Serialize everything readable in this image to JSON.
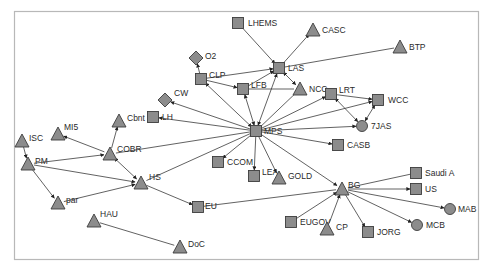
{
  "diagram": {
    "type": "directed network graph",
    "colors": {
      "node_fill": "#8c8c8c",
      "node_stroke": "#3c3c3c",
      "edge": "#3a3a3a",
      "frame": "#b8b8b8",
      "label": "#2a2a2a"
    },
    "nodes": [
      {
        "id": "LHEMS",
        "label": "LHEMS",
        "shape": "square",
        "x": 238,
        "y": 23,
        "lx": 10,
        "ly": 3
      },
      {
        "id": "CASC",
        "label": "CASC",
        "shape": "triangle",
        "x": 313,
        "y": 30,
        "lx": 9,
        "ly": 3
      },
      {
        "id": "BTP",
        "label": "BTP",
        "shape": "triangle",
        "x": 400,
        "y": 47,
        "lx": 9,
        "ly": 3
      },
      {
        "id": "O2",
        "label": "O2",
        "shape": "diamond",
        "x": 196,
        "y": 58,
        "lx": 9,
        "ly": 1
      },
      {
        "id": "CLP",
        "label": "CLP",
        "shape": "square",
        "x": 201,
        "y": 79,
        "lx": 8,
        "ly": -1
      },
      {
        "id": "LAS",
        "label": "LAS",
        "shape": "square",
        "x": 279,
        "y": 68,
        "lx": 9,
        "ly": 3
      },
      {
        "id": "LFB",
        "label": "LFB",
        "shape": "square",
        "x": 243,
        "y": 89,
        "lx": 8,
        "ly": -1
      },
      {
        "id": "NCC",
        "label": "NCC",
        "shape": "triangle",
        "x": 300,
        "y": 89,
        "lx": 9,
        "ly": 3
      },
      {
        "id": "LRT",
        "label": "LRT",
        "shape": "square",
        "x": 331,
        "y": 94,
        "lx": 8,
        "ly": -1
      },
      {
        "id": "WCC",
        "label": "WCC",
        "shape": "square",
        "x": 378,
        "y": 100,
        "lx": 10,
        "ly": 3
      },
      {
        "id": "CW",
        "label": "CW",
        "shape": "diamond",
        "x": 165,
        "y": 100,
        "lx": 9,
        "ly": -4
      },
      {
        "id": "LH",
        "label": "LH",
        "shape": "square",
        "x": 153,
        "y": 117,
        "lx": 9,
        "ly": 3
      },
      {
        "id": "MPS",
        "label": "MPS",
        "shape": "square",
        "x": 256,
        "y": 131,
        "lx": 8,
        "ly": 3
      },
      {
        "id": "7JAS",
        "label": "7JAS",
        "shape": "circle",
        "x": 362,
        "y": 126,
        "lx": 9,
        "ly": 3
      },
      {
        "id": "CASB",
        "label": "CASB",
        "shape": "square",
        "x": 338,
        "y": 145,
        "lx": 9,
        "ly": 3
      },
      {
        "id": "MI5",
        "label": "MI5",
        "shape": "triangle",
        "x": 58,
        "y": 134,
        "lx": 6,
        "ly": -4
      },
      {
        "id": "Cbnt",
        "label": "Cbnt",
        "shape": "triangle",
        "x": 119,
        "y": 121,
        "lx": 8,
        "ly": 0
      },
      {
        "id": "ISC",
        "label": "ISC",
        "shape": "triangle",
        "x": 22,
        "y": 141,
        "lx": 7,
        "ly": 0
      },
      {
        "id": "COBR",
        "label": "COBR",
        "shape": "triangle",
        "x": 110,
        "y": 154,
        "lx": 7,
        "ly": -2
      },
      {
        "id": "PM",
        "label": "PM",
        "shape": "triangle",
        "x": 28,
        "y": 164,
        "lx": 7,
        "ly": 0
      },
      {
        "id": "HS",
        "label": "HS",
        "shape": "triangle",
        "x": 141,
        "y": 183,
        "lx": 8,
        "ly": -3
      },
      {
        "id": "CCOM",
        "label": "CCOM",
        "shape": "square",
        "x": 218,
        "y": 162,
        "lx": 9,
        "ly": 3
      },
      {
        "id": "LEA",
        "label": "LEA",
        "shape": "square",
        "x": 254,
        "y": 176,
        "lx": 8,
        "ly": -1
      },
      {
        "id": "GOLD",
        "label": "GOLD",
        "shape": "triangle",
        "x": 279,
        "y": 178,
        "lx": 9,
        "ly": 1
      },
      {
        "id": "BG",
        "label": "BG",
        "shape": "triangle",
        "x": 342,
        "y": 189,
        "lx": 6,
        "ly": -1
      },
      {
        "id": "Saudi A",
        "label": "Saudi A",
        "shape": "square",
        "x": 416,
        "y": 173,
        "lx": 9,
        "ly": 3
      },
      {
        "id": "US",
        "label": "US",
        "shape": "square",
        "x": 416,
        "y": 189,
        "lx": 9,
        "ly": 3
      },
      {
        "id": "MAB",
        "label": "MAB",
        "shape": "circle",
        "x": 450,
        "y": 209,
        "lx": 8,
        "ly": 3
      },
      {
        "id": "EU",
        "label": "EU",
        "shape": "square",
        "x": 198,
        "y": 207,
        "lx": 7,
        "ly": 2
      },
      {
        "id": "par",
        "label": "par",
        "shape": "triangle",
        "x": 58,
        "y": 203,
        "lx": 8,
        "ly": 0
      },
      {
        "id": "EUGOV",
        "label": "EUGOV",
        "shape": "square",
        "x": 291,
        "y": 222,
        "lx": 9,
        "ly": 3
      },
      {
        "id": "CP",
        "label": "CP",
        "shape": "triangle",
        "x": 327,
        "y": 229,
        "lx": 9,
        "ly": 1
      },
      {
        "id": "JORG",
        "label": "JORG",
        "shape": "square",
        "x": 368,
        "y": 232,
        "lx": 9,
        "ly": 3
      },
      {
        "id": "MCB",
        "label": "MCB",
        "shape": "circle",
        "x": 417,
        "y": 225,
        "lx": 9,
        "ly": 3
      },
      {
        "id": "HAU",
        "label": "HAU",
        "shape": "triangle",
        "x": 94,
        "y": 221,
        "lx": 6,
        "ly": -4
      },
      {
        "id": "DoC",
        "label": "DoC",
        "shape": "triangle",
        "x": 180,
        "y": 247,
        "lx": 8,
        "ly": 0
      }
    ],
    "edges": [
      {
        "from": "LHEMS",
        "to": "LAS"
      },
      {
        "from": "LAS",
        "to": "CASC"
      },
      {
        "from": "BTP",
        "to": "LAS",
        "arrow": false
      },
      {
        "from": "CLP",
        "to": "O2"
      },
      {
        "from": "CLP",
        "to": "LAS"
      },
      {
        "from": "CLP",
        "to": "LFB"
      },
      {
        "from": "LFB",
        "to": "LAS"
      },
      {
        "from": "NCC",
        "to": "LAS",
        "both": true
      },
      {
        "from": "LFB",
        "to": "NCC",
        "arrow": false
      },
      {
        "from": "LRT",
        "to": "WCC"
      },
      {
        "from": "LRT",
        "to": "7JAS",
        "both": true
      },
      {
        "from": "7JAS",
        "to": "WCC",
        "both": true
      },
      {
        "from": "MPS",
        "to": "CLP",
        "both": true
      },
      {
        "from": "MPS",
        "to": "LFB",
        "both": true
      },
      {
        "from": "MPS",
        "to": "LAS",
        "both": true
      },
      {
        "from": "MPS",
        "to": "NCC",
        "arrow": false
      },
      {
        "from": "MPS",
        "to": "LRT"
      },
      {
        "from": "MPS",
        "to": "WCC"
      },
      {
        "from": "MPS",
        "to": "7JAS"
      },
      {
        "from": "MPS",
        "to": "CASB"
      },
      {
        "from": "MPS",
        "to": "CW"
      },
      {
        "from": "MPS",
        "to": "LH"
      },
      {
        "from": "MPS",
        "to": "CCOM"
      },
      {
        "from": "MPS",
        "to": "LEA"
      },
      {
        "from": "MPS",
        "to": "GOLD"
      },
      {
        "from": "MPS",
        "to": "BG"
      },
      {
        "from": "COBR",
        "to": "MPS",
        "arrow": false
      },
      {
        "from": "HS",
        "to": "MPS",
        "arrow": false
      },
      {
        "from": "COBR",
        "to": "Cbnt"
      },
      {
        "from": "COBR",
        "to": "MI5"
      },
      {
        "from": "PM",
        "to": "COBR"
      },
      {
        "from": "HS",
        "to": "COBR",
        "both": true
      },
      {
        "from": "PM",
        "to": "HS"
      },
      {
        "from": "par",
        "to": "HS"
      },
      {
        "from": "ISC",
        "to": "PM"
      },
      {
        "from": "PM",
        "to": "par"
      },
      {
        "from": "HS",
        "to": "EU"
      },
      {
        "from": "EU",
        "to": "BG",
        "arrow": false
      },
      {
        "from": "BG",
        "to": "Saudi A",
        "arrow": false
      },
      {
        "from": "BG",
        "to": "US"
      },
      {
        "from": "BG",
        "to": "MAB"
      },
      {
        "from": "BG",
        "to": "MCB"
      },
      {
        "from": "BG",
        "to": "JORG"
      },
      {
        "from": "EUGOV",
        "to": "BG"
      },
      {
        "from": "CP",
        "to": "BG"
      },
      {
        "from": "HAU",
        "to": "DoC",
        "arrow": false
      }
    ]
  }
}
